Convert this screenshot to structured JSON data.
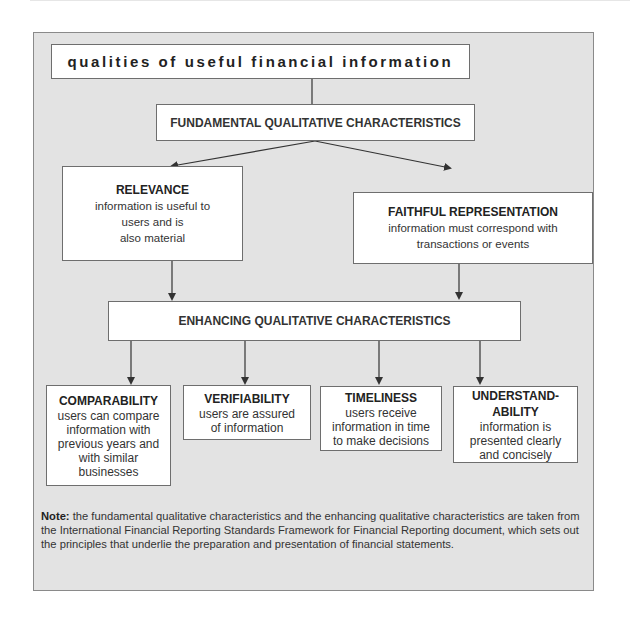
{
  "diagram": {
    "title": "qualities of useful financial information",
    "fundamental": {
      "label": "FUNDAMENTAL QUALITATIVE CHARACTERISTICS",
      "items": [
        {
          "name": "RELEVANCE",
          "lines": [
            "information is  useful to",
            "users and is",
            "also material"
          ]
        },
        {
          "name": "FAITHFUL REPRESENTATION",
          "lines": [
            "information must correspond with",
            "transactions or events"
          ]
        }
      ]
    },
    "enhancing": {
      "label": "ENHANCING QUALITATIVE CHARACTERISTICS",
      "items": [
        {
          "name": "COMPARABILITY",
          "lines": [
            "users can compare",
            "information with",
            "previous years and",
            "with similar",
            "businesses"
          ]
        },
        {
          "name": "VERIFIABILITY",
          "lines": [
            "users are assured",
            "of information"
          ]
        },
        {
          "name": "TIMELINESS",
          "lines": [
            "users receive",
            "information in time",
            "to make decisions"
          ]
        },
        {
          "name_lines": [
            "UNDERSTAND-",
            "ABILITY"
          ],
          "lines": [
            "information is",
            "presented clearly",
            "and concisely"
          ]
        }
      ]
    },
    "note": {
      "label": "Note:",
      "text": " the fundamental qualitative characteristics and the enhancing qualitative characteristics are taken from the International Financial Reporting Standards Framework for Financial Reporting document, which sets out the principles that underlie the preparation and presentation of financial statements."
    },
    "colors": {
      "panel_bg": "#e3e3e3",
      "box_bg": "#ffffff",
      "border": "#6e6e6e",
      "arrow": "#333333"
    }
  }
}
